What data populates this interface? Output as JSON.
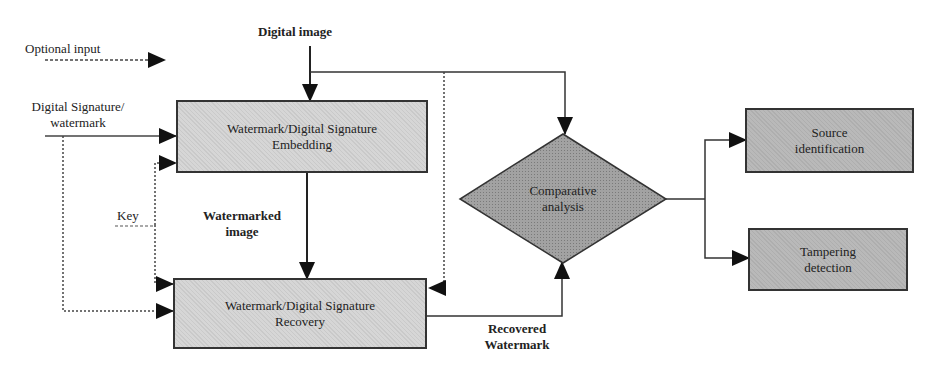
{
  "diagram": {
    "inputs": {
      "optional_input": "Optional input",
      "digital_image": "Digital image",
      "digital_signature": [
        "Digital Signature/",
        "watermark"
      ],
      "key": "Key"
    },
    "nodes": {
      "embedding": [
        "Watermark/Digital Signature",
        "Embedding"
      ],
      "recovery": [
        "Watermark/Digital Signature",
        "Recovery"
      ],
      "comparative": [
        "Comparative",
        "analysis"
      ],
      "source": [
        "Source",
        "identification"
      ],
      "tampering": [
        "Tampering",
        "detection"
      ]
    },
    "edge_labels": {
      "watermarked_image": [
        "Watermarked",
        "image"
      ],
      "recovered_watermark": [
        "Recovered",
        "Watermark"
      ]
    },
    "colors": {
      "box_fill": "#d6d6d6",
      "diamond_fill": "#9e9e9e",
      "output_box_fill": "#b9b9b9",
      "line": "#222222"
    }
  }
}
